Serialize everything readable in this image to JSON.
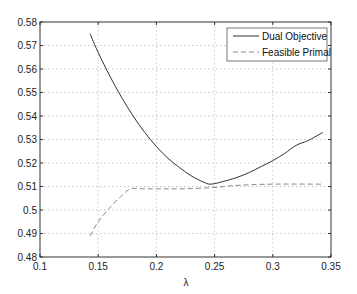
{
  "chart_data": {
    "type": "line",
    "title": "",
    "xlabel": "λ",
    "ylabel": "",
    "xlim": [
      0.1,
      0.35
    ],
    "ylim": [
      0.48,
      0.58
    ],
    "xticks": [
      "0.1",
      "0.15",
      "0.2",
      "0.25",
      "0.3",
      "0.35"
    ],
    "yticks": [
      "0.48",
      "0.49",
      "0.5",
      "0.51",
      "0.52",
      "0.53",
      "0.54",
      "0.55",
      "0.56",
      "0.57",
      "0.58"
    ],
    "grid": true,
    "legend_position": "upper right",
    "series": [
      {
        "name": "Dual Objective",
        "style": "solid",
        "color": "#333333",
        "x": [
          0.143,
          0.15,
          0.16,
          0.17,
          0.18,
          0.19,
          0.2,
          0.21,
          0.22,
          0.23,
          0.24,
          0.247,
          0.26,
          0.27,
          0.28,
          0.29,
          0.3,
          0.31,
          0.32,
          0.33,
          0.343
        ],
        "y": [
          0.575,
          0.567,
          0.557,
          0.548,
          0.54,
          0.533,
          0.527,
          0.522,
          0.518,
          0.5145,
          0.512,
          0.511,
          0.5125,
          0.514,
          0.516,
          0.5185,
          0.521,
          0.524,
          0.5275,
          0.5295,
          0.533
        ]
      },
      {
        "name": "Feasible Primal",
        "style": "dashed",
        "color": "#888888",
        "x": [
          0.143,
          0.15,
          0.16,
          0.17,
          0.178,
          0.19,
          0.2,
          0.22,
          0.247,
          0.27,
          0.3,
          0.343
        ],
        "y": [
          0.489,
          0.495,
          0.501,
          0.506,
          0.509,
          0.509,
          0.509,
          0.509,
          0.5095,
          0.5105,
          0.511,
          0.511
        ]
      }
    ]
  },
  "legend": {
    "items": [
      "Dual Objective",
      "Feasible Primal"
    ]
  }
}
